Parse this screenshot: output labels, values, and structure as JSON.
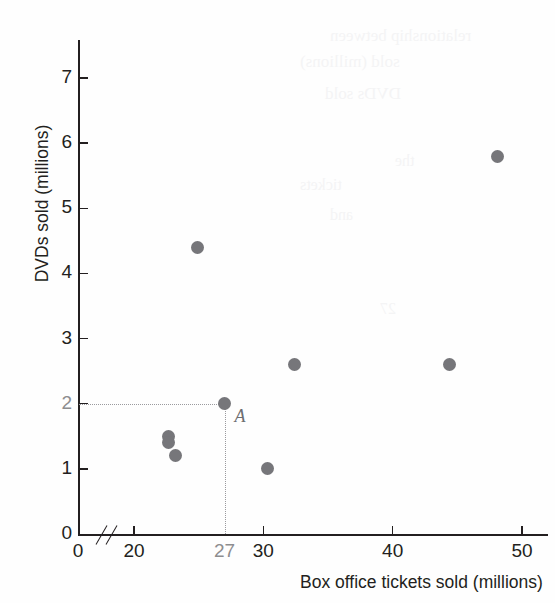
{
  "chart_data": {
    "type": "scatter",
    "title": "",
    "xlabel": "Box office tickets sold (millions)",
    "ylabel": "DVDs sold (millions)",
    "xlim": [
      18,
      51.5
    ],
    "ylim": [
      0,
      7.6
    ],
    "x_ticks": [
      {
        "value": 0,
        "label": "0",
        "highlight": false
      },
      {
        "value": 20,
        "label": "20",
        "highlight": false
      },
      {
        "value": 27,
        "label": "27",
        "highlight": true
      },
      {
        "value": 30,
        "label": "30",
        "highlight": false
      },
      {
        "value": 40,
        "label": "40",
        "highlight": false
      },
      {
        "value": 50,
        "label": "50",
        "highlight": false
      }
    ],
    "y_ticks": [
      {
        "value": 0,
        "label": "0",
        "highlight": false
      },
      {
        "value": 1,
        "label": "1",
        "highlight": false
      },
      {
        "value": 2,
        "label": "2",
        "highlight": true
      },
      {
        "value": 3,
        "label": "3",
        "highlight": false
      },
      {
        "value": 4,
        "label": "4",
        "highlight": false
      },
      {
        "value": 5,
        "label": "5",
        "highlight": false
      },
      {
        "value": 6,
        "label": "6",
        "highlight": false
      },
      {
        "value": 7,
        "label": "7",
        "highlight": false
      }
    ],
    "axis_break": {
      "axis": "x",
      "between": [
        0,
        20
      ]
    },
    "grid": false,
    "legend": null,
    "points": [
      {
        "x": 22.7,
        "y": 1.5,
        "label": ""
      },
      {
        "x": 22.7,
        "y": 1.4,
        "label": ""
      },
      {
        "x": 23.2,
        "y": 1.2,
        "label": ""
      },
      {
        "x": 24.9,
        "y": 4.4,
        "label": ""
      },
      {
        "x": 27.0,
        "y": 2.0,
        "label": "A"
      },
      {
        "x": 30.3,
        "y": 1.0,
        "label": ""
      },
      {
        "x": 32.4,
        "y": 2.6,
        "label": ""
      },
      {
        "x": 44.4,
        "y": 2.6,
        "label": ""
      },
      {
        "x": 48.1,
        "y": 5.8,
        "label": ""
      }
    ],
    "annotations": [
      {
        "name": "point-A-label",
        "text": "A",
        "x": 27.0,
        "y": 2.0
      },
      {
        "name": "guide-horizontal",
        "from": [
          18,
          2.0
        ],
        "to": [
          27.0,
          2.0
        ],
        "style": "dotted"
      },
      {
        "name": "guide-vertical",
        "from": [
          27.0,
          0
        ],
        "to": [
          27.0,
          2.0
        ],
        "style": "dotted"
      }
    ],
    "colors": {
      "marker": "#76767a",
      "axis": "#231f20",
      "guide": "#9a9a9e",
      "highlight_label": "#8d8d8f",
      "background": "#fefefe"
    }
  },
  "background_bleed": [
    {
      "text": "relationship between",
      "x": 330,
      "y": 26,
      "size": 17
    },
    {
      "text": "sold (millions)",
      "x": 300,
      "y": 52,
      "size": 17
    },
    {
      "text": "DVDs sold",
      "x": 325,
      "y": 84,
      "size": 17
    },
    {
      "text": "the",
      "x": 395,
      "y": 152,
      "size": 16
    },
    {
      "text": "tickets",
      "x": 300,
      "y": 176,
      "size": 16
    },
    {
      "text": "and",
      "x": 330,
      "y": 206,
      "size": 16
    },
    {
      "text": "27",
      "x": 380,
      "y": 300,
      "size": 16
    }
  ]
}
